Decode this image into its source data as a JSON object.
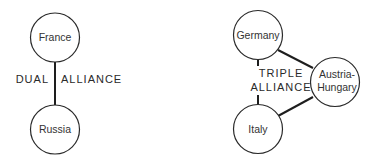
{
  "diagram": {
    "dual_alliance": {
      "label_left": "DUAL",
      "label_right": "ALLIANCE",
      "nodes": [
        {
          "id": "france",
          "label": "France"
        },
        {
          "id": "russia",
          "label": "Russia"
        }
      ],
      "edges": [
        [
          "france",
          "russia"
        ]
      ]
    },
    "triple_alliance": {
      "label_line1": "TRIPLE",
      "label_line2": "ALLIANCE",
      "nodes": [
        {
          "id": "germany",
          "label": "Germany"
        },
        {
          "id": "austria_hungary",
          "label_line1": "Austria-",
          "label_line2": "Hungary"
        },
        {
          "id": "italy",
          "label": "Italy"
        }
      ],
      "edges": [
        [
          "germany",
          "italy"
        ],
        [
          "germany",
          "austria_hungary"
        ],
        [
          "italy",
          "austria_hungary"
        ]
      ]
    },
    "colors": {
      "stroke": "#2a2a2a",
      "text": "#333333",
      "background": "#ffffff"
    }
  }
}
